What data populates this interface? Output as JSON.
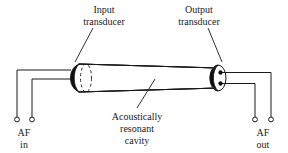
{
  "figure": {
    "background_color": "#ffffff",
    "ink_color": "#1a1a1a",
    "fill_color": "#101010"
  },
  "labels": {
    "input_transducer_line1": "Input",
    "input_transducer_line2": "transducer",
    "output_transducer_line1": "Output",
    "output_transducer_line2": "transducer",
    "cavity_line1": "Acoustically",
    "cavity_line2": "resonant",
    "cavity_line3": "cavity",
    "af_in_line1": "AF",
    "af_in_line2": "in",
    "af_out_line1": "AF",
    "af_out_line2": "out"
  },
  "components": {
    "cavity": {
      "name": "Acoustically resonant cavity",
      "shape": "cylinder",
      "left_x": 72,
      "right_x": 216,
      "top_y": 62,
      "bottom_y": 92
    },
    "input_transducer": {
      "name": "Input transducer",
      "position": "left end cap",
      "terminals": 2
    },
    "output_transducer": {
      "name": "Output transducer",
      "position": "right end cap",
      "terminals": 2
    }
  },
  "terminals": {
    "af_in": {
      "label": "AF in",
      "count": 2,
      "positions": [
        17,
        32
      ]
    },
    "af_out": {
      "label": "AF out",
      "count": 2,
      "positions": [
        255,
        271
      ]
    }
  }
}
